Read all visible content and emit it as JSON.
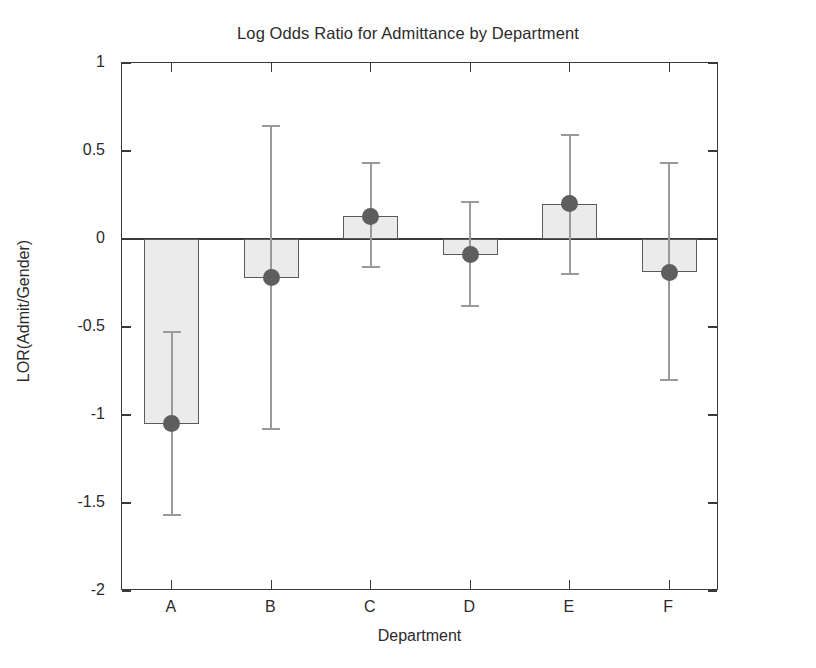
{
  "chart_data": {
    "type": "bar",
    "title": "Log Odds Ratio for Admittance by Department",
    "xlabel": "Department",
    "ylabel": "LOR(Admit/Gender)",
    "categories": [
      "A",
      "B",
      "C",
      "D",
      "E",
      "F"
    ],
    "values": [
      -1.05,
      -0.22,
      0.13,
      -0.09,
      0.2,
      -0.19
    ],
    "errors_low": [
      -1.57,
      -1.08,
      -0.16,
      -0.38,
      -0.2,
      -0.8
    ],
    "errors_high": [
      -0.53,
      0.64,
      0.43,
      0.21,
      0.59,
      0.43
    ],
    "series": [
      {
        "name": "LOR(Admit/Gender)",
        "values": [
          -1.05,
          -0.22,
          0.13,
          -0.09,
          0.2,
          -0.19
        ]
      }
    ],
    "points": [
      {
        "category": "A",
        "value": -1.05,
        "ci_low": -1.57,
        "ci_high": -0.53
      },
      {
        "category": "B",
        "value": -0.22,
        "ci_low": -1.08,
        "ci_high": 0.64
      },
      {
        "category": "C",
        "value": 0.13,
        "ci_low": -0.16,
        "ci_high": 0.43
      },
      {
        "category": "D",
        "value": -0.09,
        "ci_low": -0.38,
        "ci_high": 0.21
      },
      {
        "category": "E",
        "value": 0.2,
        "ci_low": -0.2,
        "ci_high": 0.59
      },
      {
        "category": "F",
        "value": -0.19,
        "ci_low": -0.8,
        "ci_high": 0.43
      }
    ],
    "ylim": [
      -2,
      1
    ],
    "yticks": [
      1,
      0.5,
      0,
      -0.5,
      -1,
      -1.5,
      -2
    ],
    "ytick_labels": [
      "1",
      "0.5",
      "0",
      "-0.5",
      "-1",
      "-1.5",
      "-2"
    ],
    "grid": false,
    "legend": "none",
    "colors": {
      "bar_fill": "#ebebeb",
      "bar_edge": "#5b5b5b",
      "marker": "#5e5e5e",
      "error_bar": "#9a9a9a",
      "axis": "#3a3a3a",
      "text": "#2b2b2b",
      "background": "#ffffff"
    }
  }
}
